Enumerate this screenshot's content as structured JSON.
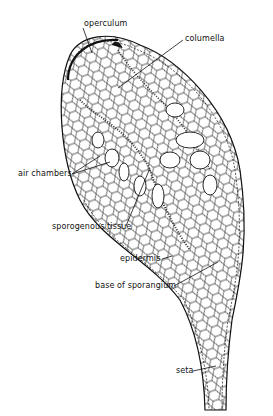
{
  "figure": {
    "labels": [
      {
        "id": "operculum",
        "text": "operculum"
      },
      {
        "id": "columella",
        "text": "columella"
      },
      {
        "id": "air-chambers",
        "text": "air chambers"
      },
      {
        "id": "sporogenous-tissue",
        "text": "sporogenous tissue"
      },
      {
        "id": "epidermis",
        "text": "epidermis"
      },
      {
        "id": "base-of-sporangium",
        "text": "base of sporangium"
      },
      {
        "id": "seta",
        "text": "seta"
      }
    ],
    "colors": {
      "ink": "#111111",
      "background": "#ffffff"
    }
  }
}
